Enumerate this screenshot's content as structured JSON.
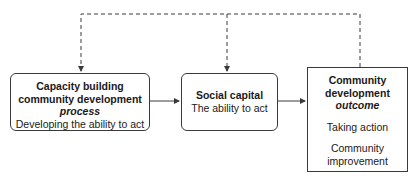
{
  "diagram": {
    "nodes": [
      {
        "id": "capacity-building",
        "title_lines": [
          "Capacity building",
          "community development"
        ],
        "emphasis": "process",
        "description": "Developing the ability to act"
      },
      {
        "id": "social-capital",
        "title": "Social capital",
        "description": "The ability to act"
      },
      {
        "id": "community-development-outcome",
        "title_lines": [
          "Community",
          "development"
        ],
        "emphasis": "outcome",
        "items": [
          "Taking action",
          "Community",
          "improvement"
        ]
      }
    ],
    "edges": [
      {
        "from": "capacity-building",
        "to": "social-capital",
        "style": "solid"
      },
      {
        "from": "social-capital",
        "to": "community-development-outcome",
        "style": "solid"
      },
      {
        "from": "community-development-outcome",
        "to": "capacity-building",
        "style": "dashed"
      },
      {
        "from": "community-development-outcome",
        "to": "social-capital",
        "style": "dashed"
      }
    ],
    "colors": {
      "line": "#3a3a3a",
      "text": "#1a1a1a",
      "background": "#ffffff"
    }
  }
}
